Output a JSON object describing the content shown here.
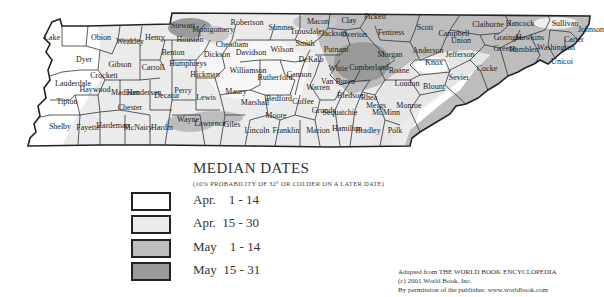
{
  "legend": {
    "title": "MEDIAN DATES",
    "subtitle": "(10% PROBABILITY OF 32° OR COLDER ON A LATER DATE)",
    "items": [
      {
        "label": "Apr.    1 - 14",
        "color": "#ffffff"
      },
      {
        "label": "Apr.  15 - 30",
        "color": "#ebebeb"
      },
      {
        "label": "May    1 - 14",
        "color": "#bdbdbd"
      },
      {
        "label": "May  15 - 31",
        "color": "#9a9a9a"
      }
    ]
  },
  "credit": {
    "line1": "Adapted from THE WORLD BOOK ENCYCLOPEDIA",
    "line2": "(c) 2001 World Book, Inc.",
    "line3": "By permission of the publisher. www.worldbook.com"
  },
  "map": {
    "region": "Tennessee",
    "counties": [
      {
        "name": "Lake",
        "x": 52,
        "y": 40
      },
      {
        "name": "Obion",
        "x": 101,
        "y": 40
      },
      {
        "name": "Weakley",
        "x": 130,
        "y": 44
      },
      {
        "name": "Henry",
        "x": 155,
        "y": 40
      },
      {
        "name": "Stewart",
        "x": 183,
        "y": 28
      },
      {
        "name": "Montgomery",
        "x": 213,
        "y": 32
      },
      {
        "name": "Robertson",
        "x": 247,
        "y": 25
      },
      {
        "name": "Sumner",
        "x": 281,
        "y": 30
      },
      {
        "name": "Macon",
        "x": 318,
        "y": 24
      },
      {
        "name": "Clay",
        "x": 349,
        "y": 23
      },
      {
        "name": "Pickett",
        "x": 375,
        "y": 19
      },
      {
        "name": "Fentress",
        "x": 391,
        "y": 35
      },
      {
        "name": "Scott",
        "x": 425,
        "y": 30
      },
      {
        "name": "Campbell",
        "x": 454,
        "y": 36
      },
      {
        "name": "Claiborne",
        "x": 488,
        "y": 27
      },
      {
        "name": "Hancock",
        "x": 520,
        "y": 26
      },
      {
        "name": "Hawkins",
        "x": 530,
        "y": 40
      },
      {
        "name": "Sullivan",
        "x": 565,
        "y": 26
      },
      {
        "name": "Johnson",
        "x": 591,
        "y": 32
      },
      {
        "name": "Carter",
        "x": 574,
        "y": 42
      },
      {
        "name": "Washington",
        "x": 556,
        "y": 50
      },
      {
        "name": "Unicoi",
        "x": 562,
        "y": 64
      },
      {
        "name": "Greene",
        "x": 505,
        "y": 51
      },
      {
        "name": "Cocke",
        "x": 487,
        "y": 71
      },
      {
        "name": "Hamblen",
        "x": 524,
        "y": 52
      },
      {
        "name": "Grainger",
        "x": 508,
        "y": 40
      },
      {
        "name": "Jefferson",
        "x": 460,
        "y": 57
      },
      {
        "name": "Sevier",
        "x": 459,
        "y": 80
      },
      {
        "name": "Knox",
        "x": 434,
        "y": 65
      },
      {
        "name": "Union",
        "x": 461,
        "y": 43
      },
      {
        "name": "Anderson",
        "x": 428,
        "y": 53
      },
      {
        "name": "Morgan",
        "x": 390,
        "y": 57
      },
      {
        "name": "Roane",
        "x": 399,
        "y": 73
      },
      {
        "name": "Loudon",
        "x": 407,
        "y": 86
      },
      {
        "name": "Blount",
        "x": 434,
        "y": 89
      },
      {
        "name": "Monroe",
        "x": 409,
        "y": 108
      },
      {
        "name": "Polk",
        "x": 395,
        "y": 133
      },
      {
        "name": "Dyer",
        "x": 84,
        "y": 62
      },
      {
        "name": "Gibson",
        "x": 120,
        "y": 67
      },
      {
        "name": "Carroll",
        "x": 153,
        "y": 70
      },
      {
        "name": "Benton",
        "x": 173,
        "y": 55
      },
      {
        "name": "Houston",
        "x": 190,
        "y": 42
      },
      {
        "name": "Humphreys",
        "x": 188,
        "y": 66
      },
      {
        "name": "Dickson",
        "x": 217,
        "y": 57
      },
      {
        "name": "Cheatham",
        "x": 232,
        "y": 47
      },
      {
        "name": "Davidson",
        "x": 251,
        "y": 55
      },
      {
        "name": "Wilson",
        "x": 282,
        "y": 52
      },
      {
        "name": "Trousdale",
        "x": 306,
        "y": 34
      },
      {
        "name": "Smith",
        "x": 305,
        "y": 46
      },
      {
        "name": "Jackson",
        "x": 334,
        "y": 36
      },
      {
        "name": "Overton",
        "x": 354,
        "y": 37
      },
      {
        "name": "Putnam",
        "x": 336,
        "y": 52
      },
      {
        "name": "DeKalb",
        "x": 311,
        "y": 62
      },
      {
        "name": "White",
        "x": 338,
        "y": 71
      },
      {
        "name": "Cumberland",
        "x": 369,
        "y": 70
      },
      {
        "name": "Lauderdale",
        "x": 73,
        "y": 86
      },
      {
        "name": "Crockett",
        "x": 104,
        "y": 78
      },
      {
        "name": "Haywood",
        "x": 95,
        "y": 92
      },
      {
        "name": "Madison",
        "x": 125,
        "y": 95
      },
      {
        "name": "Henderson",
        "x": 144,
        "y": 95
      },
      {
        "name": "Decatur",
        "x": 167,
        "y": 98
      },
      {
        "name": "Perry",
        "x": 183,
        "y": 93
      },
      {
        "name": "Hickman",
        "x": 205,
        "y": 77
      },
      {
        "name": "Williamson",
        "x": 248,
        "y": 73
      },
      {
        "name": "Rutherford",
        "x": 275,
        "y": 80
      },
      {
        "name": "Cannon",
        "x": 299,
        "y": 77
      },
      {
        "name": "Warren",
        "x": 318,
        "y": 90
      },
      {
        "name": "Van Buren",
        "x": 338,
        "y": 84
      },
      {
        "name": "Bledsoe",
        "x": 350,
        "y": 98
      },
      {
        "name": "Rhea",
        "x": 369,
        "y": 100
      },
      {
        "name": "Meigs",
        "x": 376,
        "y": 108
      },
      {
        "name": "McMinn",
        "x": 386,
        "y": 115
      },
      {
        "name": "Tipton",
        "x": 67,
        "y": 104
      },
      {
        "name": "Chester",
        "x": 130,
        "y": 110
      },
      {
        "name": "Lewis",
        "x": 206,
        "y": 100
      },
      {
        "name": "Maury",
        "x": 236,
        "y": 94
      },
      {
        "name": "Marshall",
        "x": 255,
        "y": 105
      },
      {
        "name": "Bedford",
        "x": 279,
        "y": 101
      },
      {
        "name": "Coffee",
        "x": 303,
        "y": 104
      },
      {
        "name": "Grundy",
        "x": 324,
        "y": 113
      },
      {
        "name": "Sequatchie",
        "x": 340,
        "y": 115
      },
      {
        "name": "Hamilton",
        "x": 347,
        "y": 131
      },
      {
        "name": "Bradley",
        "x": 368,
        "y": 133
      },
      {
        "name": "Shelby",
        "x": 60,
        "y": 129
      },
      {
        "name": "Fayette",
        "x": 88,
        "y": 130
      },
      {
        "name": "Hardeman",
        "x": 113,
        "y": 128
      },
      {
        "name": "McNairy",
        "x": 138,
        "y": 130
      },
      {
        "name": "Hardin",
        "x": 162,
        "y": 130
      },
      {
        "name": "Wayne",
        "x": 188,
        "y": 122
      },
      {
        "name": "Lawrence",
        "x": 210,
        "y": 126
      },
      {
        "name": "Giles",
        "x": 232,
        "y": 127
      },
      {
        "name": "Lincoln",
        "x": 257,
        "y": 133
      },
      {
        "name": "Moore",
        "x": 276,
        "y": 118
      },
      {
        "name": "Franklin",
        "x": 286,
        "y": 133
      },
      {
        "name": "Marion",
        "x": 318,
        "y": 133
      }
    ]
  }
}
